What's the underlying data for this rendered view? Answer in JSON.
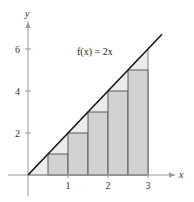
{
  "chart_data": {
    "type": "area",
    "title": "",
    "function_label": "f(x) = 2x",
    "xlabel": "x",
    "ylabel": "y",
    "xlim": [
      0,
      3.5
    ],
    "ylim": [
      0,
      7
    ],
    "x_ticks": [
      1,
      2,
      3
    ],
    "y_ticks": [
      2,
      4,
      6
    ],
    "grid": false,
    "line": {
      "name": "f(x) = 2x",
      "x": [
        0,
        3.35
      ],
      "y": [
        0,
        6.7
      ]
    },
    "shaded_region": {
      "description": "area under f(x)=2x from x=0 to x=3",
      "x": [
        0,
        3
      ],
      "y": [
        0,
        6
      ]
    },
    "rectangles": {
      "description": "inscribed (left-endpoint) rectangles, width 0.5",
      "width": 0.5,
      "x_left": [
        0.5,
        1.0,
        1.5,
        2.0,
        2.5
      ],
      "heights": [
        1,
        2,
        3,
        4,
        5
      ]
    }
  },
  "labels": {
    "x_axis": "x",
    "y_axis": "y",
    "func": "f(x) = 2x",
    "x_ticks": [
      "1",
      "2",
      "3"
    ],
    "y_ticks": [
      "2",
      "4",
      "6"
    ]
  },
  "colors": {
    "axis": "#9a9a9a",
    "line": "#1a1a1a",
    "rect_fill": "#d2d2d2",
    "rect_stroke": "#5a5a5a",
    "region_fill": "#ececec"
  }
}
